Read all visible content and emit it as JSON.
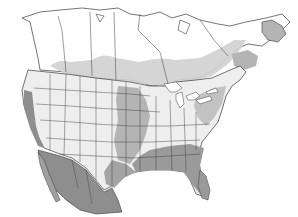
{
  "map": {
    "type": "range-distribution-map",
    "region": "North America",
    "background": "#ffffff",
    "colors": {
      "water": "#ffffff",
      "land_light": "#f0f0f0",
      "zone_light": "#d6d6d6",
      "zone_mid": "#b4b4b4",
      "zone_dark": "#8e8e8e",
      "border": "#3a3a3a"
    },
    "legend": null,
    "labels": []
  }
}
